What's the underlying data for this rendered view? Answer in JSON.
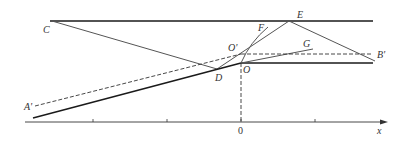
{
  "diagram": {
    "labels": {
      "C": "C",
      "E": "E",
      "F": "F",
      "G": "G",
      "O_prime": "O'",
      "O": "O",
      "D": "D",
      "A_prime": "A'",
      "B_prime": "B'",
      "zero": "0",
      "x_axis": "x"
    },
    "colors": {
      "bold_line": "#1a1a1a",
      "thin_line": "#555555",
      "dashed_line": "#333333"
    }
  }
}
